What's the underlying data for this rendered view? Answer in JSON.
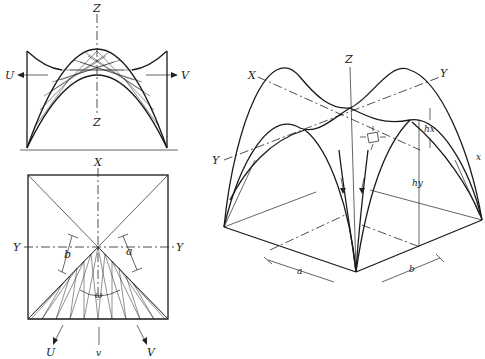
{
  "diagram": {
    "panels": [
      {
        "id": "elevation",
        "labels": {
          "z_top": "Z",
          "z_bottom": "Z",
          "u": "U",
          "v": "V"
        }
      },
      {
        "id": "plan",
        "labels": {
          "x": "X",
          "y_left": "Y",
          "y_right": "Y",
          "a": "a",
          "b": "b",
          "omega": "ω",
          "u": "U",
          "v_small": "v",
          "v": "V"
        }
      },
      {
        "id": "axonometric",
        "labels": {
          "z": "Z",
          "x_top": "X",
          "y_top": "Y",
          "y_left": "Y",
          "x_right": "x",
          "hx": "hx",
          "hy": "hy",
          "a": "a",
          "b": "b"
        }
      }
    ],
    "colors": {
      "line": "#1a1a1a",
      "background": "#ffffff"
    }
  }
}
